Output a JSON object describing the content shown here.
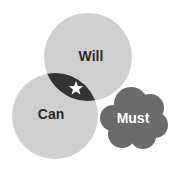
{
  "diagram": {
    "type": "venn",
    "circles": [
      {
        "id": "will",
        "label": "Will",
        "cx": 88,
        "cy": 57,
        "r": 44,
        "fill": "#cfcfcf",
        "text_color": "#2b2b2b"
      },
      {
        "id": "can",
        "label": "Can",
        "cx": 55,
        "cy": 116,
        "r": 43,
        "fill": "#cfcfcf",
        "text_color": "#2b2b2b"
      }
    ],
    "intersection": {
      "between": [
        "Will",
        "Can"
      ],
      "fill": "#333333",
      "icon": "star-icon",
      "icon_color": "#ffffff"
    },
    "cloud": {
      "id": "must",
      "label": "Must",
      "fill": "#6b6b6b",
      "text_color": "#ffffff"
    }
  }
}
